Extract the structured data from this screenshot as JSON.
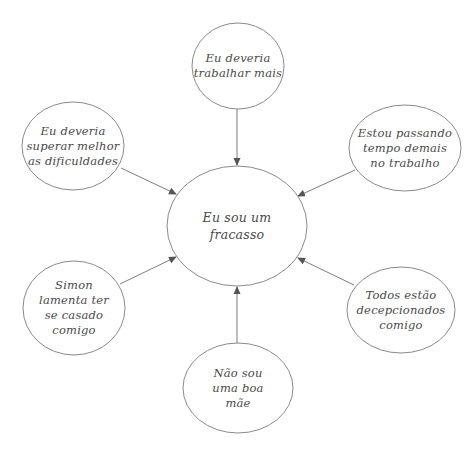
{
  "diagram": {
    "type": "mind-map",
    "center": {
      "id": "center",
      "lines": [
        "Eu sou um",
        "fracasso"
      ],
      "cx": 237,
      "cy": 226,
      "rx": 70,
      "ry": 60
    },
    "nodes": [
      {
        "id": "top",
        "lines": [
          "Eu deveria",
          "trabalhar mais"
        ],
        "cx": 238,
        "cy": 66,
        "rx": 46,
        "ry": 43
      },
      {
        "id": "top-left",
        "lines": [
          "Eu deveria",
          "superar melhor",
          "as dificuldades"
        ],
        "cx": 73,
        "cy": 146,
        "rx": 51,
        "ry": 44
      },
      {
        "id": "top-right",
        "lines": [
          "Estou passando",
          "tempo demais",
          "no trabalho"
        ],
        "cx": 405,
        "cy": 148,
        "rx": 56,
        "ry": 43
      },
      {
        "id": "bottom-left",
        "lines": [
          "Simon",
          "lamenta ter",
          "se casado",
          "comigo"
        ],
        "cx": 74,
        "cy": 308,
        "rx": 51,
        "ry": 47
      },
      {
        "id": "bottom-right",
        "lines": [
          "Todos estão",
          "decepcionados",
          "comigo"
        ],
        "cx": 401,
        "cy": 310,
        "rx": 54,
        "ry": 43
      },
      {
        "id": "bottom",
        "lines": [
          "Não sou",
          "uma boa",
          "mãe"
        ],
        "cx": 238,
        "cy": 388,
        "rx": 55,
        "ry": 45
      }
    ],
    "edges": [
      {
        "from": "top",
        "to": "center",
        "x1": 237,
        "y1": 109,
        "x2": 237,
        "y2": 165
      },
      {
        "from": "top-left",
        "to": "center",
        "x1": 121,
        "y1": 168,
        "x2": 176,
        "y2": 194
      },
      {
        "from": "top-right",
        "to": "center",
        "x1": 355,
        "y1": 170,
        "x2": 298,
        "y2": 196
      },
      {
        "from": "bottom-left",
        "to": "center",
        "x1": 120,
        "y1": 284,
        "x2": 176,
        "y2": 257
      },
      {
        "from": "bottom-right",
        "to": "center",
        "x1": 354,
        "y1": 285,
        "x2": 298,
        "y2": 258
      },
      {
        "from": "bottom",
        "to": "center",
        "x1": 237,
        "y1": 343,
        "x2": 237,
        "y2": 287
      }
    ],
    "colors": {
      "stroke": "#8a8a8a",
      "text": "#4a4a4a",
      "background": "#ffffff"
    }
  }
}
